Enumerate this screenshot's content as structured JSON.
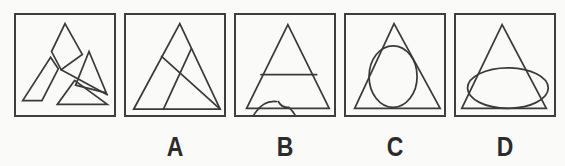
{
  "page": {
    "background": "#fafaf8",
    "ink_color": "#3a3a3a",
    "label_color": "#2b2b2b"
  },
  "puzzle": {
    "question_box": {
      "figure": "exploded-dissected-triangle",
      "shapes": [
        {
          "type": "path",
          "d": "M51,9 L69,41 L47,57 L37,38 Z"
        },
        {
          "type": "path",
          "d": "M36,44 L44,56 L27,89 L7,89 Z"
        },
        {
          "type": "path",
          "d": "M76,38 L94,81 L62,73 Z"
        },
        {
          "type": "path",
          "d": "M43,93 L95,93 L61,68 Z"
        },
        {
          "type": "line",
          "x1": 47,
          "y1": 57,
          "x2": 95,
          "y2": 83
        }
      ]
    },
    "options": [
      {
        "label": "A",
        "figure": "triangle-with-two-crossing-lines",
        "shapes": [
          {
            "type": "path",
            "d": "M56,9 L8,98 L98,98 Z"
          },
          {
            "type": "line",
            "x1": 37,
            "y1": 43,
            "x2": 98,
            "y2": 98
          },
          {
            "type": "line",
            "x1": 68,
            "y1": 35,
            "x2": 39,
            "y2": 98
          }
        ]
      },
      {
        "label": "B",
        "figure": "triangle-with-overlapping-open-circle-and-chord",
        "shapes": [
          {
            "type": "path",
            "d": "M54,10 L11,97 L97,97 Z"
          },
          {
            "type": "path",
            "d": "M42,90 A26,33 0 1 0 55,96 Q48,97 44,90"
          },
          {
            "type": "line",
            "x1": 26,
            "y1": 62,
            "x2": 84,
            "y2": 62
          }
        ]
      },
      {
        "label": "C",
        "figure": "triangle-with-inscribed-tall-ellipse",
        "shapes": [
          {
            "type": "path",
            "d": "M50,9 L9,97 L98,97 Z"
          },
          {
            "type": "ellipse",
            "cx": 49,
            "cy": 64,
            "rx": 25,
            "ry": 32
          }
        ]
      },
      {
        "label": "D",
        "figure": "triangle-with-wide-ellipse-bulging-through-sides",
        "shapes": [
          {
            "type": "path",
            "d": "M48,10 L6,97 L94,97 Z"
          },
          {
            "type": "ellipse",
            "cx": 54,
            "cy": 76,
            "rx": 42,
            "ry": 21
          }
        ]
      }
    ]
  }
}
